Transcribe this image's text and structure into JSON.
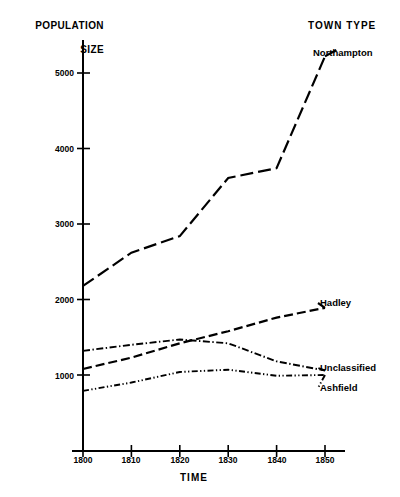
{
  "chart_data": {
    "type": "line",
    "title": "",
    "ylabel": "POPULATION\nSIZE",
    "ylabel_line1": "POPULATION",
    "ylabel_line2": "SIZE",
    "xlabel": "TIME",
    "legend_title": "TOWN TYPE",
    "legend_position": "right-of-lines",
    "grid": false,
    "x": [
      1800,
      1810,
      1820,
      1830,
      1840,
      1850
    ],
    "categories": [
      "1800",
      "1810",
      "1820",
      "1830",
      "1840",
      "1850"
    ],
    "xlim": [
      1795,
      1852
    ],
    "ylim": [
      0,
      5600
    ],
    "xticks": [
      "1800",
      "1810",
      "1820",
      "1830",
      "1840",
      "1850"
    ],
    "yticks": [
      "1000",
      "2000",
      "3000",
      "4000",
      "5000"
    ],
    "ytick_values": [
      1000,
      2000,
      3000,
      4000,
      5000
    ],
    "series": [
      {
        "name": "Northampton",
        "style": "long-dash",
        "values": [
          2180,
          2620,
          2840,
          3610,
          3740,
          5220
        ]
      },
      {
        "name": "Hadley",
        "style": "dashed",
        "values": [
          1080,
          1230,
          1420,
          1580,
          1760,
          1890
        ]
      },
      {
        "name": "Unclassified",
        "style": "dash-dot",
        "values": [
          1320,
          1400,
          1470,
          1420,
          1180,
          1060
        ]
      },
      {
        "name": "Ashfield",
        "style": "dash-dot-dot",
        "values": [
          790,
          900,
          1040,
          1070,
          990,
          1000
        ]
      }
    ]
  },
  "axes": {
    "y_axis_name": "population-size-axis",
    "x_axis_name": "time-axis"
  }
}
